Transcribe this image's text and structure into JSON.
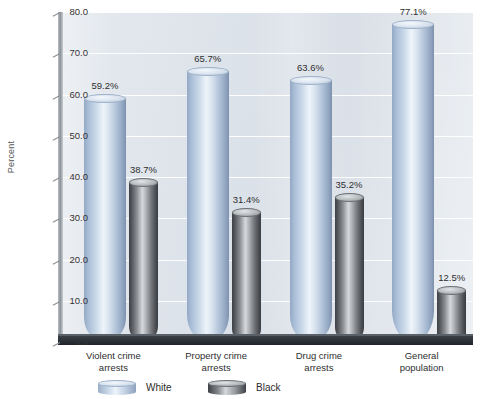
{
  "chart_data": {
    "type": "bar",
    "title": "",
    "subtitle": "",
    "xlabel": "",
    "ylabel": "Percent",
    "ylim": [
      0.0,
      80.0
    ],
    "ytick_step": 10.0,
    "ytick_labels": [
      "0.0",
      "10.0",
      "20.0",
      "30.0",
      "40.0",
      "50.0",
      "60.0",
      "70.0",
      "80.0"
    ],
    "ytick_values": [
      0.0,
      10.0,
      20.0,
      30.0,
      40.0,
      50.0,
      60.0,
      70.0,
      80.0
    ],
    "grid": true,
    "legend_position": "bottom",
    "style": "3d-cylinder",
    "categories": [
      "Violent crime\narrests",
      "Property crime\narrests",
      "Drug crime\narrests",
      "General\npopulation"
    ],
    "series": [
      {
        "name": "White",
        "color": "#b6c9de",
        "values": [
          59.2,
          65.7,
          63.6,
          77.1
        ],
        "data_labels": [
          "59.2%",
          "65.7%",
          "63.6%",
          "77.1%"
        ]
      },
      {
        "name": "Black",
        "color": "#6e7276",
        "values": [
          38.7,
          31.4,
          35.2,
          12.5
        ],
        "data_labels": [
          "38.7%",
          "31.4%",
          "35.2%",
          "12.5%"
        ]
      }
    ]
  },
  "colors": {
    "plot_background": "#dde3ea",
    "gridline": "#ffffff",
    "floor": "#2a2e34",
    "axis": "#8d9299",
    "text": "#2e2e2e"
  }
}
